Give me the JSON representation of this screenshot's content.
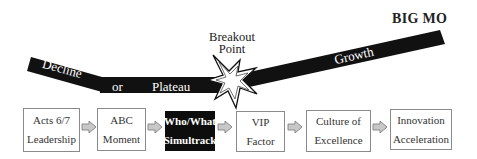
{
  "diagram": {
    "title": "BIG MO",
    "breakout": {
      "line1": "Breakout",
      "line2": "Point"
    },
    "path_labels": {
      "decline": "Decline",
      "or": "or",
      "plateau": "Plateau",
      "growth": "Growth"
    },
    "steps": [
      {
        "line1": "Acts 6/7",
        "line2": "Leadership",
        "highlight": false
      },
      {
        "line1": "ABC",
        "line2": "Moment",
        "highlight": false
      },
      {
        "line1": "Who/What",
        "line2": "Simultrack",
        "highlight": true
      },
      {
        "line1": "VIP",
        "line2": "Factor",
        "highlight": false
      },
      {
        "line1": "Culture of",
        "line2": "Excellence",
        "highlight": false
      },
      {
        "line1": "Innovation",
        "line2": "Acceleration",
        "highlight": false
      }
    ],
    "colors": {
      "band": "#111111",
      "box_border": "#8a8a8a",
      "highlight_box": "#0d0d0d",
      "arrow_fill": "#c8c8c8",
      "arrow_stroke": "#8a8a8a"
    }
  }
}
